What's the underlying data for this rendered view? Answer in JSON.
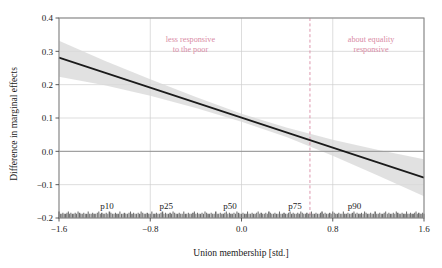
{
  "chart_data": {
    "type": "line",
    "title": "",
    "xlabel": "Union membership [std.]",
    "ylabel": "Difference in marginal effects",
    "xlim": [
      -1.6,
      1.6
    ],
    "ylim": [
      -0.2,
      0.4
    ],
    "xticks": [
      -1.6,
      -0.8,
      0.0,
      0.8,
      1.6
    ],
    "xticklabels": [
      "−1.6",
      "−0.8",
      "0.0",
      "0.8",
      "1.6"
    ],
    "yticks": [
      -0.2,
      -0.1,
      0.0,
      0.1,
      0.2,
      0.3,
      0.4
    ],
    "yticklabels": [
      "−0.2",
      "−0.1",
      "0.0",
      "0.1",
      "0.2",
      "0.3",
      "0.4"
    ],
    "grid": true,
    "grid_color": "#cfcfcf",
    "legend": "none",
    "series": [
      {
        "name": "Difference in marginal effects (fitted)",
        "type": "line",
        "color": "#1a1a1a",
        "x": [
          -1.6,
          -1.2,
          -0.8,
          -0.4,
          0.0,
          0.4,
          0.8,
          1.2,
          1.6
        ],
        "values": [
          0.281,
          0.236,
          0.191,
          0.146,
          0.101,
          0.056,
          0.011,
          -0.034,
          -0.079
        ]
      },
      {
        "name": "95% confidence band",
        "type": "area",
        "color": "#d9d9d9",
        "x": [
          -1.6,
          -1.2,
          -0.8,
          -0.4,
          0.0,
          0.4,
          0.8,
          1.2,
          1.6
        ],
        "upper": [
          0.332,
          0.272,
          0.216,
          0.163,
          0.113,
          0.071,
          0.035,
          0.004,
          -0.024
        ],
        "lower": [
          0.224,
          0.198,
          0.167,
          0.13,
          0.089,
          0.042,
          -0.013,
          -0.073,
          -0.135
        ]
      }
    ],
    "reference_lines": [
      {
        "name": "p75-reference",
        "orientation": "vertical",
        "x": 0.6,
        "color": "#d98ba5",
        "style": "dashed"
      }
    ],
    "zero_line": {
      "name": "zero-line",
      "orientation": "horizontal",
      "y": 0.0,
      "color": "#8a8a8a"
    },
    "annotations": [
      {
        "name": "less-responsive-annotation",
        "text_line1": "less responsive",
        "text_line2": "to the poor",
        "x": 0.36,
        "y": 0.88,
        "color": "#d98ba5"
      },
      {
        "name": "about-equality-annotation",
        "text_line1": "about equality",
        "text_line2": "responsive",
        "x": 0.855,
        "y": 0.88,
        "color": "#d98ba5"
      }
    ],
    "percentile_markers": [
      {
        "label": "p10",
        "x": -1.18
      },
      {
        "label": "p25",
        "x": -0.66
      },
      {
        "label": "p50",
        "x": -0.1
      },
      {
        "label": "p75",
        "x": 0.47
      },
      {
        "label": "p90",
        "x": 0.99
      }
    ],
    "rug": {
      "name": "rug-plot",
      "y": -0.2,
      "color": "#6e6e6e",
      "description": "dense rug of observations along the bottom axis spanning the full x-range",
      "x": [
        -1.6,
        -1.588,
        -1.575,
        -1.566,
        -1.554,
        -1.541,
        -1.53,
        -1.518,
        -1.509,
        -1.496,
        -1.482,
        -1.47,
        -1.458,
        -1.447,
        -1.433,
        -1.42,
        -1.408,
        -1.396,
        -1.383,
        -1.37,
        -1.357,
        -1.344,
        -1.331,
        -1.318,
        -1.305,
        -1.292,
        -1.278,
        -1.264,
        -1.251,
        -1.238,
        -1.225,
        -1.212,
        -1.199,
        -1.186,
        -1.172,
        -1.158,
        -1.145,
        -1.132,
        -1.118,
        -1.105,
        -1.092,
        -1.079,
        -1.066,
        -1.052,
        -1.039,
        -1.026,
        -1.013,
        -0.999,
        -0.986,
        -0.973,
        -0.96,
        -0.946,
        -0.933,
        -0.92,
        -0.906,
        -0.893,
        -0.88,
        -0.866,
        -0.853,
        -0.84,
        -0.826,
        -0.813,
        -0.8,
        -0.786,
        -0.773,
        -0.76,
        -0.746,
        -0.733,
        -0.72,
        -0.706,
        -0.693,
        -0.68,
        -0.666,
        -0.653,
        -0.64,
        -0.626,
        -0.613,
        -0.6,
        -0.586,
        -0.573,
        -0.56,
        -0.546,
        -0.533,
        -0.52,
        -0.506,
        -0.493,
        -0.48,
        -0.466,
        -0.453,
        -0.44,
        -0.426,
        -0.413,
        -0.4,
        -0.386,
        -0.373,
        -0.36,
        -0.346,
        -0.333,
        -0.32,
        -0.306,
        -0.293,
        -0.28,
        -0.266,
        -0.253,
        -0.24,
        -0.226,
        -0.213,
        -0.2,
        -0.186,
        -0.173,
        -0.16,
        -0.146,
        -0.133,
        -0.12,
        -0.106,
        -0.093,
        -0.08,
        -0.066,
        -0.053,
        -0.04,
        -0.026,
        -0.013,
        0.0,
        0.013,
        0.026,
        0.04,
        0.053,
        0.066,
        0.08,
        0.093,
        0.106,
        0.12,
        0.133,
        0.146,
        0.16,
        0.173,
        0.186,
        0.2,
        0.213,
        0.226,
        0.24,
        0.253,
        0.266,
        0.28,
        0.293,
        0.306,
        0.32,
        0.333,
        0.346,
        0.36,
        0.373,
        0.386,
        0.4,
        0.413,
        0.426,
        0.44,
        0.453,
        0.466,
        0.48,
        0.493,
        0.506,
        0.52,
        0.533,
        0.546,
        0.56,
        0.573,
        0.586,
        0.6,
        0.613,
        0.626,
        0.64,
        0.653,
        0.666,
        0.68,
        0.693,
        0.706,
        0.72,
        0.733,
        0.746,
        0.76,
        0.773,
        0.786,
        0.8,
        0.813,
        0.826,
        0.84,
        0.853,
        0.866,
        0.88,
        0.893,
        0.906,
        0.92,
        0.933,
        0.946,
        0.96,
        0.973,
        0.986,
        0.999,
        1.013,
        1.026,
        1.039,
        1.052,
        1.066,
        1.079,
        1.092,
        1.105,
        1.118,
        1.132,
        1.145,
        1.158,
        1.172,
        1.186,
        1.199,
        1.212,
        1.225,
        1.238,
        1.251,
        1.264,
        1.278,
        1.292,
        1.305,
        1.318,
        1.331,
        1.344,
        1.357,
        1.37,
        1.383,
        1.396,
        1.408,
        1.42,
        1.433,
        1.447,
        1.458,
        1.47,
        1.482,
        1.496,
        1.509,
        1.518,
        1.53,
        1.541,
        1.554,
        1.566,
        1.575,
        1.588,
        1.6
      ]
    }
  }
}
